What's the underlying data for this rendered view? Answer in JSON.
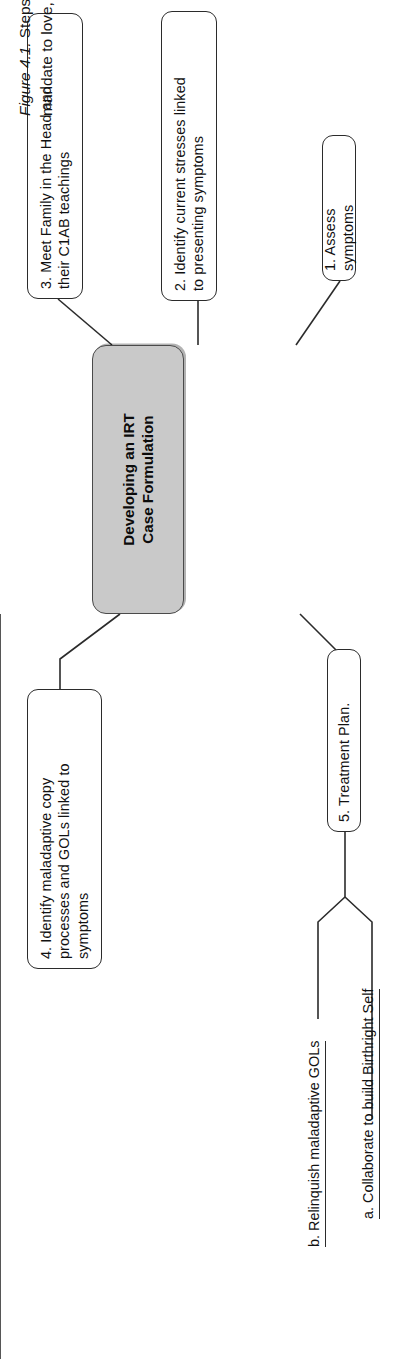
{
  "figure": {
    "hub": {
      "text": "Developing an IRT\nCase Formulation",
      "fill_color": "#c9c9c9",
      "border_color": "#4a4a4a"
    },
    "nodes": [
      {
        "id": "step-1",
        "text": "1. Assess symptoms"
      },
      {
        "id": "step-2",
        "text": "2. Identify current stresses linked\nto presenting symptoms"
      },
      {
        "id": "step-3",
        "text": "3. Meet Family in the Head and\ntheir C1AB teachings"
      },
      {
        "id": "step-4",
        "text": "4. Identify maladaptive copy\nprocesses and GOLs linked to\nsymptoms"
      },
      {
        "id": "step-5",
        "text": "5. Treatment Plan."
      }
    ],
    "subitems": [
      {
        "id": "step-5-a",
        "text": "a. Collaborate to build Birthright Self"
      },
      {
        "id": "step-5-b",
        "text": "b. Relinquish maladaptive GOLs"
      }
    ]
  },
  "caption": {
    "figure_number": "Figure 4.1.",
    "line1": " Steps in developing an IRT case formulation. Start reading at 1:00 and proceed clockwise. C1AB = primitive brain",
    "line2": "mandate to love, honor, and obey C1Gs. GOL = gift of love. IRT = Interpersonal Reconstructive Therapy."
  }
}
